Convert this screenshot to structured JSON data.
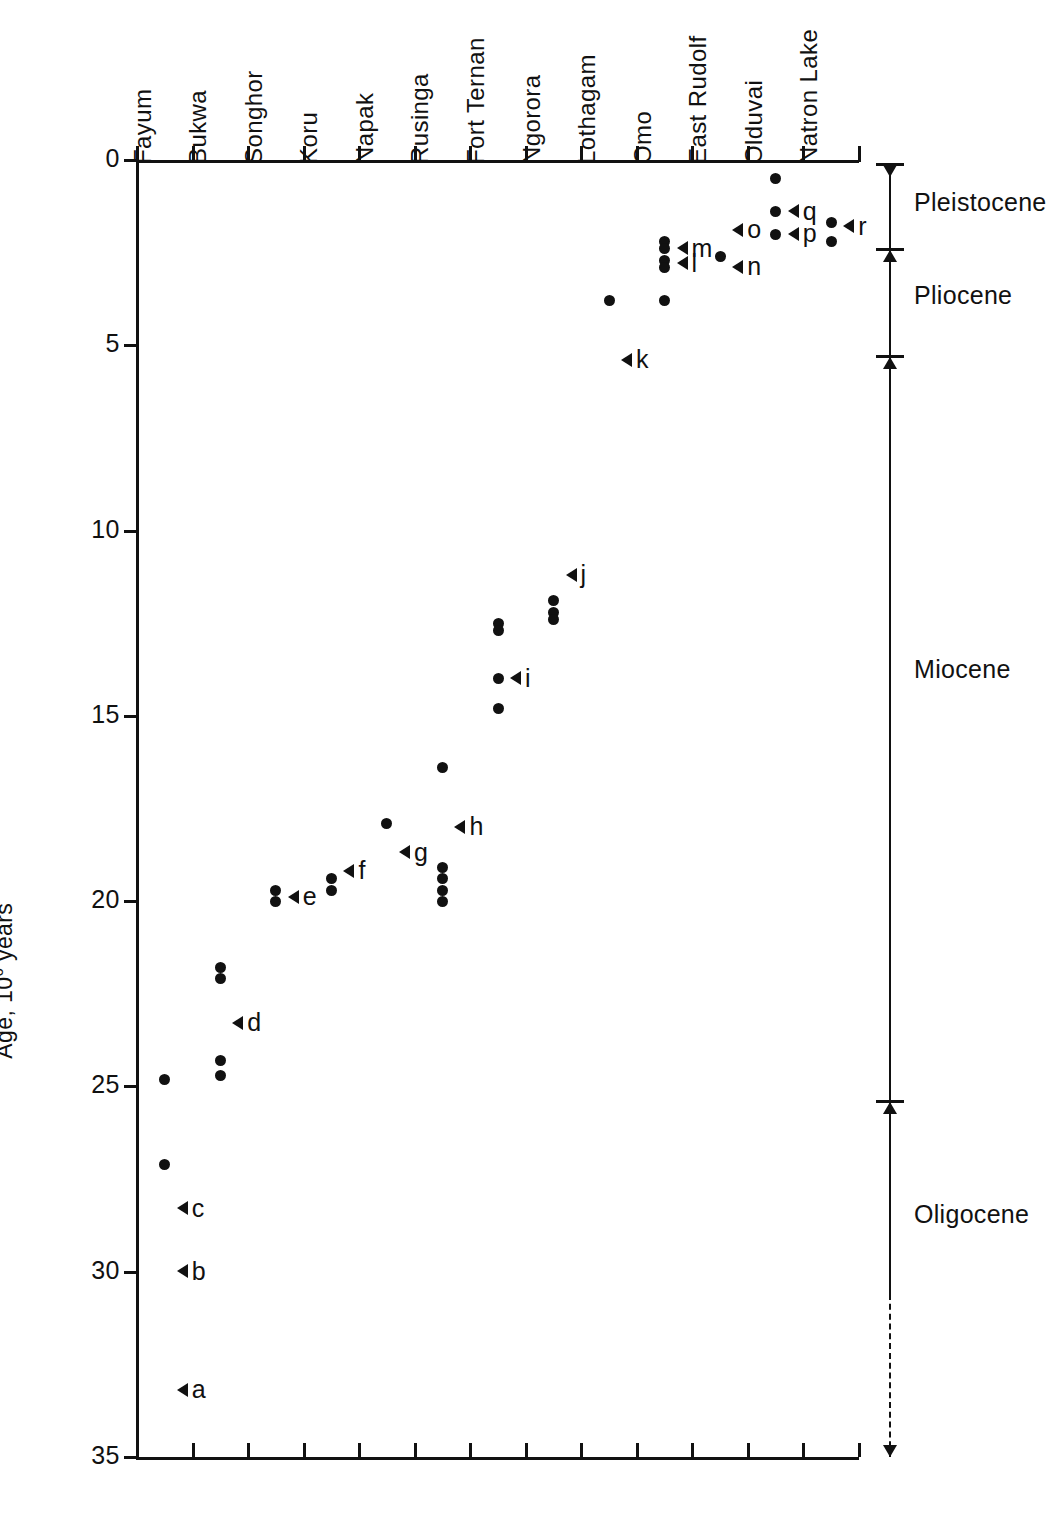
{
  "chart_data": {
    "type": "scatter",
    "title": "",
    "xlabel": "",
    "ylabel": "Age, 10⁶ years",
    "ylabel_prefix": "Age, 10",
    "ylabel_exponent": "6",
    "ylabel_suffix": " years",
    "ylim": [
      0,
      35
    ],
    "y_inverted": true,
    "grid": false,
    "legend": "none",
    "y_ticks": [
      0,
      5,
      10,
      15,
      20,
      25,
      30,
      35
    ],
    "y_tick_labels": [
      "0",
      "5",
      "10",
      "15",
      "20",
      "25",
      "30",
      "35"
    ],
    "categories": [
      "Fayum",
      "Bukwa",
      "Songhor",
      "Koru",
      "Napak",
      "Rusinga",
      "Fort Ternan",
      "Ngorora",
      "Lothagam",
      "Omo",
      "East Rudolf",
      "Olduvai",
      "Natron Lake"
    ],
    "points": [
      {
        "site": "Fayum",
        "values": [
          24.8,
          27.1
        ]
      },
      {
        "site": "Bukwa",
        "values": [
          21.8,
          22.1,
          24.3,
          24.7
        ]
      },
      {
        "site": "Songhor",
        "values": [
          19.7,
          20.0
        ]
      },
      {
        "site": "Koru",
        "values": [
          19.4,
          19.7
        ]
      },
      {
        "site": "Napak",
        "values": [
          17.9
        ]
      },
      {
        "site": "Rusinga",
        "values": [
          16.4,
          19.1,
          19.4,
          19.7,
          20.0
        ]
      },
      {
        "site": "Fort Ternan",
        "values": [
          12.5,
          12.7,
          14.0,
          14.8
        ]
      },
      {
        "site": "Ngorora",
        "values": [
          11.9,
          12.2,
          12.4
        ]
      },
      {
        "site": "Lothagam",
        "values": [
          3.8
        ]
      },
      {
        "site": "Omo",
        "values": [
          2.2,
          2.4,
          2.7,
          2.9,
          3.8
        ]
      },
      {
        "site": "East Rudolf",
        "values": [
          2.6
        ]
      },
      {
        "site": "Olduvai",
        "values": [
          0.5,
          1.4,
          2.0
        ]
      },
      {
        "site": "Natron Lake",
        "values": [
          1.7,
          2.2
        ]
      }
    ],
    "annotations": [
      {
        "label": "a",
        "site": "Fayum",
        "value": 33.2
      },
      {
        "label": "b",
        "site": "Fayum",
        "value": 30.0
      },
      {
        "label": "c",
        "site": "Fayum",
        "value": 28.3
      },
      {
        "label": "d",
        "site": "Bukwa",
        "value": 23.3
      },
      {
        "label": "e",
        "site": "Songhor",
        "value": 19.9
      },
      {
        "label": "f",
        "site": "Koru",
        "value": 19.2
      },
      {
        "label": "g",
        "site": "Napak",
        "value": 18.7
      },
      {
        "label": "h",
        "site": "Rusinga",
        "value": 18.0
      },
      {
        "label": "i",
        "site": "Fort Ternan",
        "value": 14.0
      },
      {
        "label": "j",
        "site": "Ngorora",
        "value": 11.2
      },
      {
        "label": "k",
        "site": "Lothagam",
        "value": 5.4
      },
      {
        "label": "m",
        "site": "Omo",
        "value": 2.4
      },
      {
        "label": "l",
        "site": "Omo",
        "value": 2.8
      },
      {
        "label": "n",
        "site": "East Rudolf",
        "value": 2.9
      },
      {
        "label": "o",
        "site": "East Rudolf",
        "value": 1.9
      },
      {
        "label": "q",
        "site": "Olduvai",
        "value": 1.4
      },
      {
        "label": "p",
        "site": "Olduvai",
        "value": 2.0
      },
      {
        "label": "r",
        "site": "Natron Lake",
        "value": 1.8
      }
    ],
    "epochs": [
      {
        "name": "Pleistocene",
        "from": 0.1,
        "to": 2.4,
        "label_value": 1.2
      },
      {
        "name": "Pliocene",
        "from": 2.4,
        "to": 5.3,
        "label_value": 3.7
      },
      {
        "name": "Miocene",
        "from": 5.3,
        "to": 25.4,
        "label_value": 13.8
      },
      {
        "name": "Oligocene",
        "from": 25.4,
        "to": 35.0,
        "label_value": 28.5
      }
    ]
  },
  "axis": {
    "y_title_prefix": "Age, 10",
    "y_title_exponent": "6",
    "y_title_suffix": " years"
  }
}
